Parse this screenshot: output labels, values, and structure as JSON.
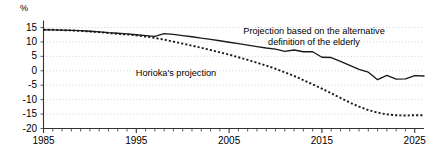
{
  "chart_data": {
    "type": "line",
    "title": "",
    "xlabel": "",
    "ylabel": "%",
    "unit_label": "%",
    "xlim": [
      1985,
      2026
    ],
    "ylim": [
      -20,
      15
    ],
    "grid": true,
    "grid_style": "dotted-horizontal",
    "legend_position": "inline-annotation",
    "ytick_labels": [
      "15",
      "10",
      "5",
      "0",
      "-5",
      "-10",
      "-15",
      "-20"
    ],
    "ytick_values": [
      15,
      10,
      5,
      0,
      -5,
      -10,
      -15,
      -20
    ],
    "xtick_labels": [
      "1985",
      "1995",
      "2005",
      "2015",
      "2025"
    ],
    "xtick_values": [
      1985,
      1995,
      2005,
      2015,
      2025
    ],
    "xtick_minor_step": 1,
    "annotations": [
      {
        "name": "alternative-definition-label",
        "text_line1": "Projection based on the alternative",
        "text_line2": "definition of the elderly",
        "x": 314,
        "y": 26
      },
      {
        "name": "horioka-projection-label",
        "text": "Horioka's projection",
        "x": 176,
        "y": 68
      }
    ],
    "series": [
      {
        "name": "Projection based on the alternative definition of the elderly",
        "style": "solid",
        "color": "#1a1a1a",
        "x": [
          1985,
          1986,
          1987,
          1988,
          1989,
          1990,
          1991,
          1992,
          1993,
          1994,
          1995,
          1996,
          1997,
          1998,
          1999,
          2000,
          2001,
          2002,
          2003,
          2004,
          2005,
          2006,
          2007,
          2008,
          2009,
          2010,
          2011,
          2012,
          2013,
          2014,
          2015,
          2016,
          2017,
          2018,
          2019,
          2020,
          2021,
          2022,
          2023,
          2024,
          2025,
          2026
        ],
        "values": [
          14.2,
          14.2,
          14.1,
          14.0,
          13.9,
          13.7,
          13.5,
          13.2,
          13.0,
          12.8,
          12.5,
          12.2,
          11.9,
          12.9,
          12.6,
          12.2,
          11.8,
          11.3,
          10.9,
          10.4,
          9.9,
          9.4,
          8.9,
          8.4,
          7.9,
          7.5,
          6.7,
          7.2,
          6.6,
          6.6,
          4.7,
          4.6,
          3.3,
          1.9,
          0.5,
          -0.5,
          -3.1,
          -1.6,
          -2.9,
          -2.8,
          -1.7,
          -1.8
        ]
      },
      {
        "name": "Horioka's projection",
        "style": "dotted",
        "color": "#1a1a1a",
        "x": [
          1985,
          1986,
          1987,
          1988,
          1989,
          1990,
          1991,
          1992,
          1993,
          1994,
          1995,
          1996,
          1997,
          1998,
          1999,
          2000,
          2001,
          2002,
          2003,
          2004,
          2005,
          2006,
          2007,
          2008,
          2009,
          2010,
          2011,
          2012,
          2013,
          2014,
          2015,
          2016,
          2017,
          2018,
          2019,
          2020,
          2021,
          2022,
          2023,
          2024,
          2025,
          2026
        ],
        "values": [
          14.2,
          14.2,
          14.1,
          14.0,
          13.8,
          13.6,
          13.4,
          13.1,
          12.8,
          12.6,
          12.3,
          11.9,
          11.4,
          10.8,
          10.1,
          9.4,
          8.7,
          8.0,
          7.2,
          6.4,
          5.6,
          4.7,
          3.8,
          2.8,
          1.8,
          0.7,
          -0.5,
          -1.8,
          -3.2,
          -4.7,
          -6.2,
          -7.8,
          -9.4,
          -11.0,
          -12.4,
          -13.6,
          -14.5,
          -15.1,
          -15.4,
          -15.5,
          -15.4,
          -15.4
        ]
      }
    ]
  }
}
